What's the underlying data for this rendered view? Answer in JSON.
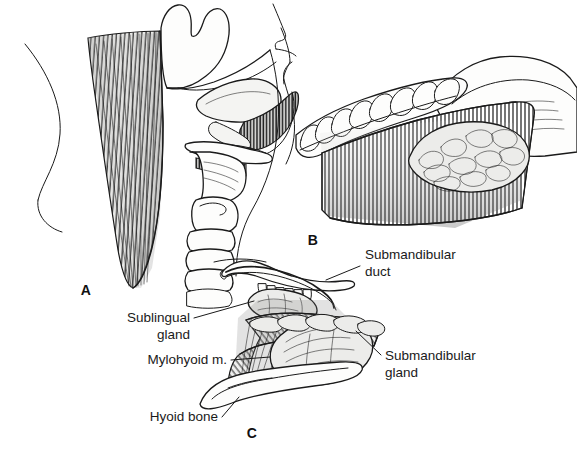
{
  "figure": {
    "background_color": "#ffffff",
    "ink_color": "#1a1a1a",
    "width": 577,
    "height": 452,
    "style": "pen-and-ink line drawing with graphite shading"
  },
  "panels": [
    {
      "id": "A",
      "letter": "A",
      "letter_x": 86,
      "letter_y": 295,
      "caption": "Lateral view of head and neck showing mylohyoid muscle, hyoid bone, larynx and trachea"
    },
    {
      "id": "B",
      "letter": "B",
      "letter_x": 313,
      "letter_y": 245,
      "caption": "Inferomedial view of mandible with sublingual gland exposed above mylohyoid muscle"
    },
    {
      "id": "C",
      "letter": "C",
      "letter_x": 252,
      "letter_y": 438,
      "caption": "Medial view of floor of mouth showing sublingual and submandibular glands with duct"
    }
  ],
  "annotations": [
    {
      "id": "submandibular-duct",
      "lines": [
        "Submandibular",
        "duct"
      ],
      "text_x": 365,
      "text_y": 260,
      "line_height": 17,
      "anchor": "start",
      "leader": "M 360 266 L 326 280"
    },
    {
      "id": "sublingual-gland",
      "lines": [
        "Sublingual",
        "gland"
      ],
      "text_x": 190,
      "text_y": 322,
      "line_height": 17,
      "anchor": "end",
      "leader": "M 194 318 L 255 301"
    },
    {
      "id": "mylohyoid-muscle",
      "lines": [
        "Mylohyoid m."
      ],
      "text_x": 227,
      "text_y": 364,
      "line_height": 17,
      "anchor": "end",
      "leader": "M 231 360 L 268 358"
    },
    {
      "id": "submandibular-gland",
      "lines": [
        "Submandibular",
        "gland"
      ],
      "text_x": 385,
      "text_y": 360,
      "line_height": 17,
      "anchor": "start",
      "leader": "M 381 355 L 356 330"
    },
    {
      "id": "hyoid-bone",
      "lines": [
        "Hyoid bone"
      ],
      "text_x": 218,
      "text_y": 421,
      "line_height": 17,
      "anchor": "end",
      "leader": "M 222 417 L 238 398"
    }
  ]
}
